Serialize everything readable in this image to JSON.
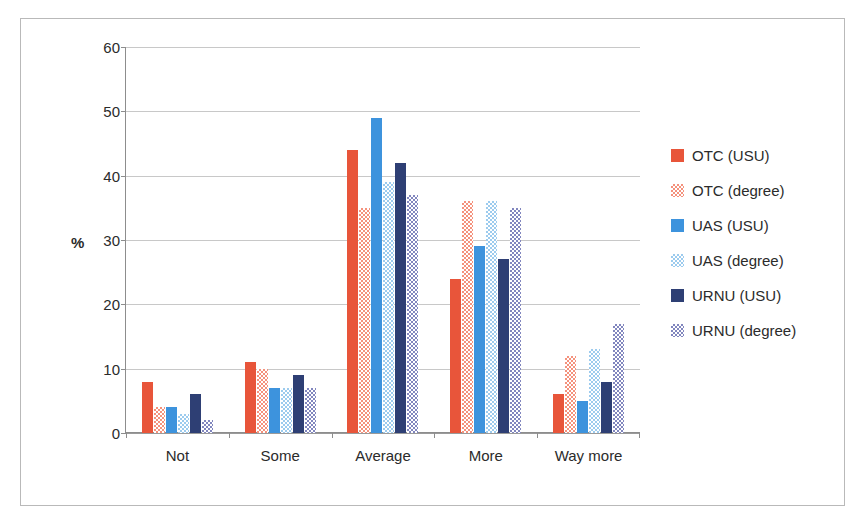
{
  "chart_data": {
    "type": "bar",
    "title": "",
    "xlabel": "",
    "ylabel": "%",
    "ylim": [
      0,
      60
    ],
    "ytick_step": 10,
    "yticks": [
      "60",
      "50",
      "40",
      "30",
      "20",
      "10",
      "0"
    ],
    "grid": true,
    "legend_position": "right",
    "categories": [
      "Not",
      "Some",
      "Average",
      "More",
      "Way more"
    ],
    "series": [
      {
        "name": "OTC (USU)",
        "color": "#E8553A",
        "fill": "solid",
        "values": [
          8,
          11,
          44,
          24,
          6
        ]
      },
      {
        "name": "OTC (degree)",
        "color": "#F4927D",
        "fill": "check",
        "values": [
          4,
          10,
          35,
          36,
          12
        ]
      },
      {
        "name": "UAS (USU)",
        "color": "#3D93DD",
        "fill": "solid",
        "values": [
          4,
          7,
          49,
          29,
          5
        ]
      },
      {
        "name": "UAS (degree)",
        "color": "#9CCBEE",
        "fill": "check",
        "values": [
          3,
          7,
          39,
          36,
          13
        ]
      },
      {
        "name": "URNU (USU)",
        "color": "#2E3F74",
        "fill": "solid",
        "values": [
          6,
          9,
          42,
          27,
          8
        ]
      },
      {
        "name": "URNU (degree)",
        "color": "#8186BE",
        "fill": "check",
        "values": [
          2,
          7,
          37,
          35,
          17
        ]
      }
    ]
  },
  "legend": {
    "items": [
      {
        "label": "OTC (USU)"
      },
      {
        "label": "OTC (degree)"
      },
      {
        "label": "UAS (USU)"
      },
      {
        "label": "UAS (degree)"
      },
      {
        "label": "URNU (USU)"
      },
      {
        "label": "URNU (degree)"
      }
    ]
  }
}
